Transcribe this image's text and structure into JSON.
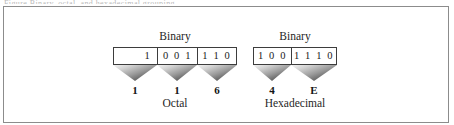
{
  "figure": {
    "caption_sliver": "Figure  Binary, octal, and hexadecimal grouping",
    "background_color": "#ffffff",
    "frame_color": "#8c8c8c",
    "box_border_color": "#3d3d3d",
    "funnel_gradient_light": "#f4f4f4",
    "funnel_gradient_dark": "#2e2e2e"
  },
  "octal_group": {
    "top_label": "Binary",
    "bottom_label": "Octal",
    "cells": [
      {
        "binary": "1",
        "result": "1"
      },
      {
        "binary": "0 0 1",
        "result": "1"
      },
      {
        "binary": "1 1 0",
        "result": "6"
      }
    ]
  },
  "hex_group": {
    "top_label": "Binary",
    "bottom_label": "Hexadecimal",
    "cells": [
      {
        "binary": "1 0 0",
        "result": "4"
      },
      {
        "binary": "1 1 1 0",
        "result": "E"
      }
    ]
  }
}
